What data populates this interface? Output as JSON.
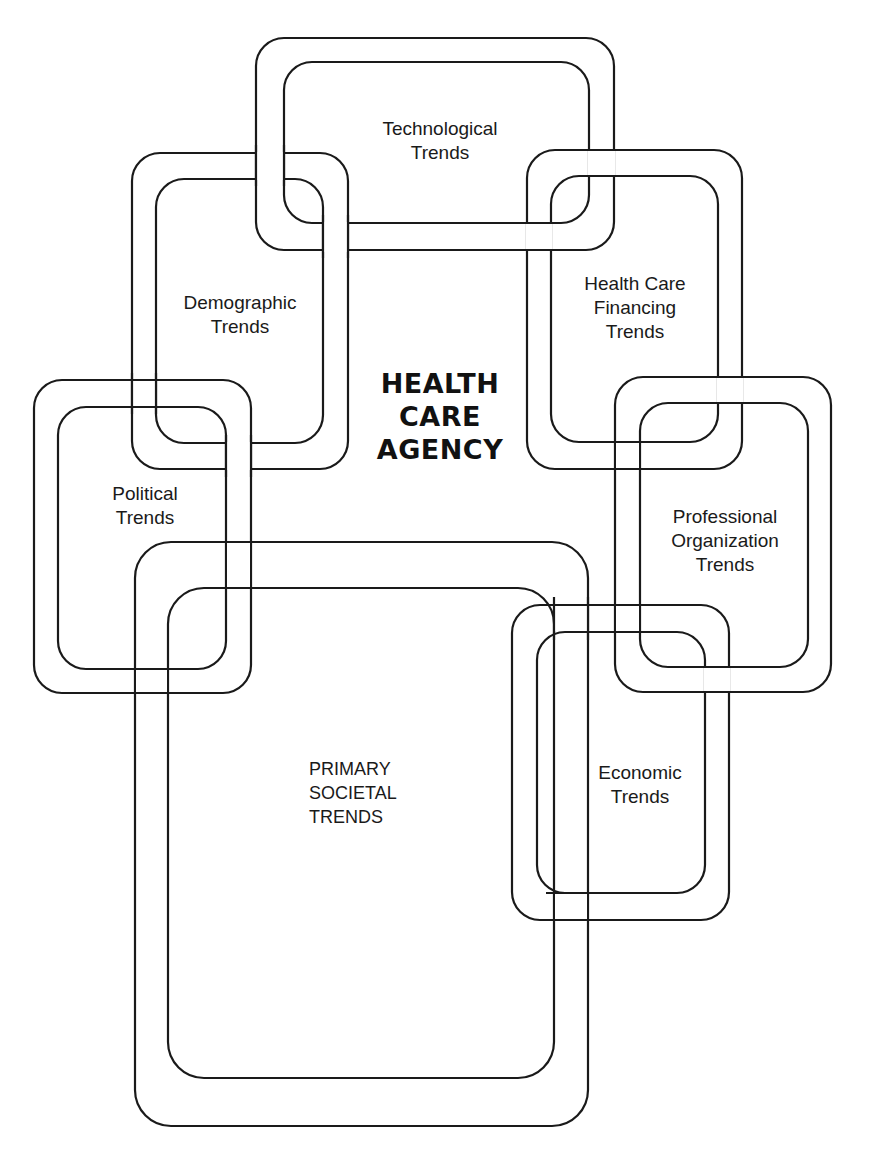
{
  "diagram": {
    "center_title": "HEALTH\nCARE\nAGENCY",
    "nodes": [
      {
        "id": "technological",
        "label": "Technological\nTrends"
      },
      {
        "id": "demographic",
        "label": "Demographic\nTrends"
      },
      {
        "id": "financing",
        "label": "Health Care\nFinancing\nTrends"
      },
      {
        "id": "political",
        "label": "Political\nTrends"
      },
      {
        "id": "professional",
        "label": "Professional\nOrganization\nTrends"
      },
      {
        "id": "economic",
        "label": "Economic\nTrends"
      },
      {
        "id": "primary",
        "label": "PRIMARY\nSOCIETAL\nTRENDS"
      }
    ],
    "colors": {
      "line": "#1a1a1a",
      "background": "#ffffff"
    }
  }
}
